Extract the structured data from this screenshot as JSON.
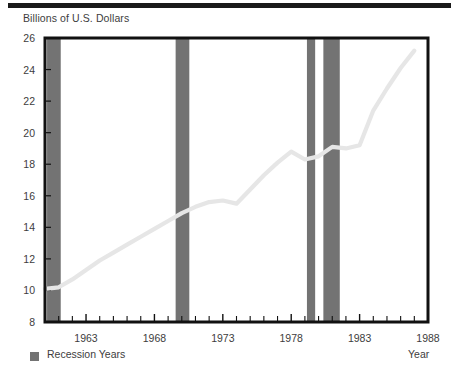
{
  "figure": {
    "y_axis_title": "Billions of U.S. Dollars",
    "x_axis_title": "Year",
    "legend_label": "Recession Years",
    "legend_swatch_color": "#737373",
    "line_color": "#e6e6e6",
    "frame_color": "#111111"
  },
  "chart_data": {
    "type": "line",
    "title": "Billions of U.S. Dollars",
    "xlabel": "Year",
    "ylabel": "Billions of U.S. Dollars",
    "xlim": [
      1960,
      1988
    ],
    "ylim": [
      8,
      26
    ],
    "yticks": [
      8,
      10,
      12,
      14,
      16,
      18,
      20,
      22,
      24,
      26
    ],
    "ytick_labels": [
      "8",
      "10",
      "12",
      "14",
      "16",
      "18",
      "20",
      "22",
      "24",
      "26"
    ],
    "xticks": [
      1963,
      1968,
      1973,
      1978,
      1983,
      1988
    ],
    "xtick_labels": [
      "1963",
      "1968",
      "1973",
      "1978",
      "1983",
      "1988"
    ],
    "x_minor_tick_step": 1,
    "grid": false,
    "legend_position": "below-axis-left",
    "series": [
      {
        "name": "Expenditures",
        "color": "#e6e6e6",
        "x": [
          1960,
          1961,
          1962,
          1963,
          1964,
          1965,
          1966,
          1967,
          1968,
          1969,
          1970,
          1971,
          1972,
          1973,
          1974,
          1975,
          1976,
          1977,
          1978,
          1979,
          1980,
          1981,
          1982,
          1983,
          1984,
          1985,
          1986,
          1987
        ],
        "values": [
          10.1,
          10.2,
          10.7,
          11.3,
          11.9,
          12.4,
          12.9,
          13.4,
          13.9,
          14.4,
          14.9,
          15.3,
          15.6,
          15.7,
          15.5,
          16.4,
          17.3,
          18.1,
          18.8,
          18.3,
          18.5,
          19.1,
          19.0,
          19.2,
          21.4,
          22.8,
          24.1,
          25.2
        ]
      }
    ],
    "recession_bands": [
      {
        "label": "Recession Years",
        "start": 1960.15,
        "end": 1961.15,
        "color": "#737373"
      },
      {
        "label": "Recession Years",
        "start": 1969.55,
        "end": 1970.55,
        "color": "#737373"
      },
      {
        "label": "Recession Years",
        "start": 1979.15,
        "end": 1979.75,
        "color": "#737373"
      },
      {
        "label": "Recession Years",
        "start": 1980.35,
        "end": 1981.55,
        "color": "#737373"
      }
    ]
  }
}
